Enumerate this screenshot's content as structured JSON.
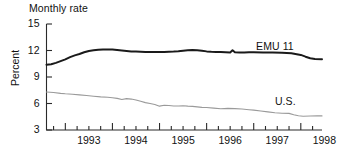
{
  "chart_data": {
    "type": "line",
    "title": "Monthly rate",
    "xlabel": "",
    "ylabel": "Percent",
    "ylim": [
      3,
      15
    ],
    "xlim": [
      1992.6,
      1998.45
    ],
    "yticks": [
      "15",
      "12",
      "9",
      "6",
      "3"
    ],
    "ytick_values": [
      15,
      12,
      9,
      6,
      3
    ],
    "xticks": [
      "1993",
      "1994",
      "1995",
      "1996",
      "1997",
      "1998"
    ],
    "xtick_values": [
      1993,
      1994,
      1995,
      1996,
      1997,
      1998
    ],
    "minor_tick_interval": 0.25,
    "grid": false,
    "legend_position": "inline-right",
    "series": [
      {
        "name": "EMU 11",
        "color": "#1a1a1a",
        "width": 2.0,
        "x": [
          1992.6,
          1992.7,
          1992.8,
          1992.9,
          1993.0,
          1993.1,
          1993.2,
          1993.3,
          1993.4,
          1993.5,
          1993.6,
          1993.7,
          1993.8,
          1993.9,
          1994.0,
          1994.1,
          1994.2,
          1994.3,
          1994.4,
          1994.5,
          1994.6,
          1994.7,
          1994.8,
          1994.9,
          1995.0,
          1995.1,
          1995.2,
          1995.3,
          1995.4,
          1995.5,
          1995.6,
          1995.7,
          1995.8,
          1995.9,
          1996.0,
          1996.1,
          1996.2,
          1996.3,
          1996.4,
          1996.5,
          1996.55,
          1996.6,
          1996.7,
          1996.8,
          1996.9,
          1997.0,
          1997.2,
          1997.4,
          1997.6,
          1997.8,
          1998.0,
          1998.1,
          1998.2,
          1998.3,
          1998.45
        ],
        "y": [
          10.4,
          10.45,
          10.6,
          10.8,
          11.0,
          11.25,
          11.45,
          11.6,
          11.8,
          11.95,
          12.02,
          12.08,
          12.12,
          12.12,
          12.1,
          12.05,
          12.0,
          11.95,
          11.9,
          11.88,
          11.85,
          11.82,
          11.82,
          11.82,
          11.82,
          11.84,
          11.86,
          11.88,
          11.92,
          11.98,
          12.02,
          12.05,
          12.02,
          11.96,
          11.9,
          11.86,
          11.84,
          11.82,
          11.8,
          11.78,
          12.02,
          11.8,
          11.78,
          11.78,
          11.8,
          11.8,
          11.78,
          11.76,
          11.74,
          11.7,
          11.5,
          11.3,
          11.12,
          11.05,
          11.02
        ]
      },
      {
        "name": "U.S.",
        "color": "#9a9a9a",
        "width": 1.1,
        "x": [
          1992.6,
          1992.75,
          1992.9,
          1993.0,
          1993.15,
          1993.3,
          1993.45,
          1993.6,
          1993.75,
          1993.9,
          1994.0,
          1994.1,
          1994.2,
          1994.3,
          1994.4,
          1994.5,
          1994.6,
          1994.7,
          1994.8,
          1994.9,
          1995.0,
          1995.1,
          1995.2,
          1995.3,
          1995.4,
          1995.5,
          1995.6,
          1995.7,
          1995.8,
          1995.9,
          1996.0,
          1996.15,
          1996.3,
          1996.45,
          1996.6,
          1996.75,
          1996.9,
          1997.0,
          1997.15,
          1997.3,
          1997.45,
          1997.6,
          1997.75,
          1997.85,
          1997.95,
          1998.05,
          1998.2,
          1998.35,
          1998.45
        ],
        "y": [
          7.3,
          7.25,
          7.15,
          7.1,
          7.05,
          6.98,
          6.9,
          6.82,
          6.75,
          6.7,
          6.65,
          6.58,
          6.45,
          6.55,
          6.5,
          6.4,
          6.25,
          6.1,
          6.0,
          5.88,
          5.7,
          5.8,
          5.78,
          5.72,
          5.72,
          5.74,
          5.7,
          5.68,
          5.62,
          5.56,
          5.55,
          5.48,
          5.4,
          5.45,
          5.42,
          5.38,
          5.3,
          5.25,
          5.15,
          5.05,
          4.95,
          4.9,
          4.88,
          4.72,
          4.62,
          4.55,
          4.58,
          4.62,
          4.6
        ]
      }
    ],
    "annotations": [
      {
        "text": "EMU 11",
        "x": 1997.05,
        "y": 12.45
      },
      {
        "text": "U.S.",
        "x": 1997.45,
        "y": 6.15
      }
    ]
  }
}
